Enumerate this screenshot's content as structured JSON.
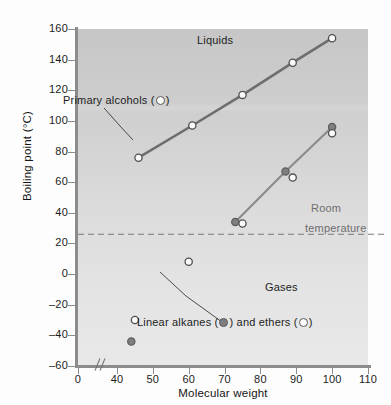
{
  "figure": {
    "background_color": "#d7d7d7",
    "alcohol_line_color": "#6e6e6e",
    "alkane_line_color": "#8c8c8c",
    "room_temp_line_color": "#7a7a7a"
  },
  "axes": {
    "x_title": "Molecular weight",
    "y_title": "Boiling point (°C)",
    "x_ticks": [
      "0",
      "40",
      "50",
      "60",
      "70",
      "80",
      "90",
      "100",
      "110"
    ],
    "y_ticks": [
      "160",
      "140",
      "120",
      "100",
      "80",
      "60",
      "40",
      "20",
      "0",
      "–20",
      "–40",
      "–60"
    ],
    "x_break": true
  },
  "annotations": {
    "liquids": "Liquids",
    "gases": "Gases",
    "room_temperature_line1": "Room",
    "room_temperature_line2": "temperature",
    "room_temperature_value": 26,
    "alcohols_label_pre": "Primary alcohols (",
    "alcohols_label_post": ")",
    "alkanes_label_pre": "Linear alkanes (",
    "alkanes_label_mid": ") and ethers (",
    "alkanes_label_post": ")"
  },
  "chart_data": {
    "type": "scatter",
    "title": "",
    "xlabel": "Molecular weight",
    "ylabel": "Boiling point (°C)",
    "xlim": [
      35,
      110
    ],
    "ylim": [
      -60,
      160
    ],
    "x_tick_values": [
      0,
      40,
      50,
      60,
      70,
      80,
      90,
      100,
      110
    ],
    "y_tick_values": [
      -60,
      -40,
      -20,
      0,
      20,
      40,
      60,
      80,
      100,
      120,
      140,
      160
    ],
    "grid": false,
    "legend_position": "in-plot-annotations",
    "series": [
      {
        "name": "Primary alcohols",
        "marker": "open-circle",
        "color": "#6e6e6e",
        "line": true,
        "points": [
          {
            "x": 46,
            "y": 76
          },
          {
            "x": 61,
            "y": 97
          },
          {
            "x": 75,
            "y": 117
          },
          {
            "x": 89,
            "y": 138
          },
          {
            "x": 100,
            "y": 154
          }
        ]
      },
      {
        "name": "Linear alkanes",
        "marker": "filled-circle",
        "color": "#8c8c8c",
        "line": true,
        "points": [
          {
            "x": 44,
            "y": -44
          },
          {
            "x": 73,
            "y": 34
          },
          {
            "x": 87,
            "y": 67
          },
          {
            "x": 100,
            "y": 96
          }
        ]
      },
      {
        "name": "Ethers",
        "marker": "open-circle",
        "color": "#8c8c8c",
        "line": false,
        "points": [
          {
            "x": 45,
            "y": -30
          },
          {
            "x": 60,
            "y": 8
          },
          {
            "x": 75,
            "y": 33
          },
          {
            "x": 89,
            "y": 63
          },
          {
            "x": 100,
            "y": 92
          }
        ]
      }
    ],
    "reference_lines": [
      {
        "name": "Room temperature",
        "axis": "y",
        "value": 26,
        "style": "dashed"
      }
    ],
    "region_labels": [
      {
        "text": "Liquids",
        "approx_x": 73,
        "approx_y": 150
      },
      {
        "text": "Gases",
        "approx_x": 96,
        "approx_y": -15
      }
    ]
  }
}
